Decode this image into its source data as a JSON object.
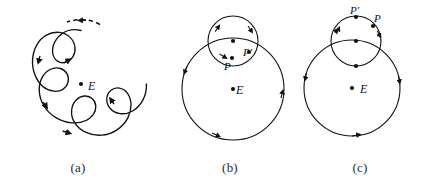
{
  "figure": {
    "background_color": "#ffffff",
    "stroke_color": "#111111",
    "width": 424,
    "height": 189
  },
  "captions": {
    "a": "(a)",
    "b": "(b)",
    "c": "(c)"
  },
  "panels": {
    "a": {
      "caption": "(a)",
      "center_label": "E",
      "center_point": {
        "x": 81,
        "y": 84
      },
      "curve_type": "epitrochoid",
      "loop_count": 4,
      "dashed_arc": true,
      "direction_arrow_count": 5
    },
    "b": {
      "caption": "(b)",
      "center_label": "E",
      "center_point": {
        "x": 233,
        "y": 89
      },
      "deferent": {
        "cx": 233,
        "cy": 89,
        "r": 51
      },
      "epicycle": {
        "cx": 233,
        "cy": 41,
        "r": 25
      },
      "point_p_label": "P",
      "point_p_prime_label": "P'",
      "point_p": {
        "x": 232,
        "y": 58
      },
      "point_p_prime": {
        "x": 249,
        "y": 52
      },
      "epicycle_center_point": {
        "x": 233,
        "y": 41
      }
    },
    "c": {
      "caption": "(c)",
      "center_label": "E",
      "center_point": {
        "x": 352,
        "y": 88
      },
      "deferent": {
        "cx": 352,
        "cy": 88,
        "r": 48
      },
      "epicycle": {
        "cx": 356,
        "cy": 41,
        "r": 25
      },
      "point_p_label": "P",
      "point_p_prime_label": "P'",
      "point_p": {
        "x": 372,
        "y": 26
      },
      "point_p_prime": {
        "x": 356,
        "y": 17
      },
      "epicycle_center_point": {
        "x": 356,
        "y": 41
      }
    }
  }
}
